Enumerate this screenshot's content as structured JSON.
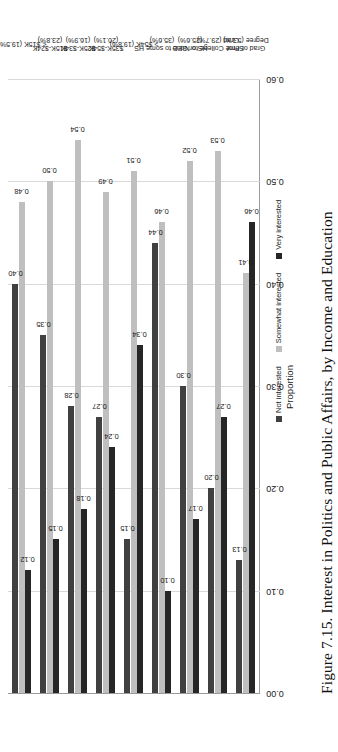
{
  "figure": {
    "caption": "Figure 7.15. Interest in Politics and Public Affairs, by Income and Education"
  },
  "legend": {
    "position": "bottom-center",
    "items": [
      {
        "label": "Not interested",
        "color": "#404040",
        "swatch_name": "legend-swatch-not-interested"
      },
      {
        "label": "Somewhat interested",
        "color": "#bfbfbf",
        "swatch_name": "legend-swatch-somewhat-interested"
      },
      {
        "label": "Very interested",
        "color": "#262626",
        "swatch_name": "legend-swatch-very-interested"
      }
    ]
  },
  "axes": {
    "ylabel": "Proportion",
    "yticks": [
      "0.00",
      "0.10",
      "0.20",
      "0.30",
      "0.40",
      "0.50",
      "0.60"
    ],
    "ymin": 0.0,
    "ymax": 0.6
  },
  "chart_data": {
    "type": "bar",
    "title": "Figure 7.15. Interest in Politics and Public Affairs, by Income and Education",
    "orientation": "horizontal",
    "xlabel": "",
    "ylabel": "Proportion",
    "ylim": [
      0.0,
      0.6
    ],
    "grid": true,
    "legend_position": "bottom-center",
    "categories": [
      "< $15K (19.5%)",
      "$15K-$24K (23.8%)",
      "$25K-$34K (16.9%)",
      "$35K-$54K (20.1%)",
      "> $54K (19.8%)",
      "None to some HS (35.6%)",
      "HS or GED (25.6%)",
      "Some College to Grad (29.7%)",
      "Grad or Prof Degree (5.1%)"
    ],
    "category_groups": [
      {
        "name": "Income",
        "categories": [
          "< $15K (19.5%)",
          "$15K-$24K (23.8%)",
          "$25K-$34K (16.9%)",
          "$35K-$54K (20.1%)",
          "> $54K (19.8%)"
        ]
      },
      {
        "name": "Education",
        "categories": [
          "None to some HS (35.6%)",
          "HS or GED (25.6%)",
          "Some College to Grad (29.7%)",
          "Grad or Prof Degree (5.1%)"
        ]
      }
    ],
    "series": [
      {
        "name": "Not interested",
        "color": "#404040",
        "values": [
          0.4,
          0.35,
          0.28,
          0.27,
          0.15,
          0.44,
          0.3,
          0.2,
          0.13
        ]
      },
      {
        "name": "Somewhat interested",
        "color": "#bfbfbf",
        "values": [
          0.48,
          0.5,
          0.54,
          0.49,
          0.51,
          0.46,
          0.52,
          0.53,
          0.41
        ]
      },
      {
        "name": "Very interested",
        "color": "#262626",
        "values": [
          0.12,
          0.15,
          0.18,
          0.24,
          0.34,
          0.1,
          0.17,
          0.27,
          0.46
        ]
      }
    ],
    "value_labels": [
      [
        "0.40",
        "0.35",
        "0.28",
        "0.27",
        "0.15",
        "0.44",
        "0.30",
        "0.20",
        "0.13"
      ],
      [
        "0.48",
        "0.50",
        "0.54",
        "0.49",
        "0.51",
        "0.46",
        "0.52",
        "0.53",
        "0.41"
      ],
      [
        "0.12",
        "0.15",
        "0.18",
        "0.24",
        "0.34",
        "0.10",
        "0.17",
        "0.27",
        "0.46"
      ]
    ]
  }
}
